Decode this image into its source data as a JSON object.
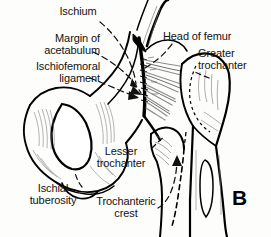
{
  "figure": {
    "panel_letter": "B",
    "background_color": "#fdfdfc",
    "ink_color": "#000000",
    "ligament_fiber_color": "#8d8d8d",
    "leader_line_color": "#111111"
  },
  "labels": {
    "ischium": "Ischium",
    "margin_of_acetabulum": "Margin of\nacetabulum",
    "ischiofemoral_ligament": "Ischiofemoral\nligament",
    "head_of_femur": "Head of femur",
    "greater_trochanter": "Greater\ntrochanter",
    "lesser_trochanter": "Lesser\ntrochanter",
    "ischial_tuberosity": "Ischial\ntuberosity",
    "trochanteric_crest": "Trochanteric\ncrest"
  },
  "structures": [
    "ischium",
    "obturator-foramen",
    "acetabular-margin",
    "ischiofemoral-ligament",
    "head-of-femur",
    "greater-trochanter",
    "lesser-trochanter",
    "ischial-tuberosity",
    "trochanteric-crest",
    "femoral-shaft"
  ]
}
